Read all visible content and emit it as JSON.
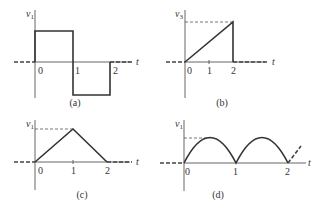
{
  "figure": {
    "panels": [
      {
        "id": "a",
        "caption": "(a)",
        "ylabel": "v",
        "ysub": "1",
        "xlabel": "t",
        "ticks": [
          "0",
          "1",
          "2"
        ],
        "shape": "square pulse: +1 on (0,1), -1 on (1,2), 0 elsewhere"
      },
      {
        "id": "b",
        "caption": "(b)",
        "ylabel": "v",
        "ysub": "3",
        "xlabel": "t",
        "ticks": [
          "0",
          "1",
          "2"
        ],
        "shape": "ramp from 0 at t=0 to peak at t=2, then drops to 0"
      },
      {
        "id": "c",
        "caption": "(c)",
        "ylabel": "v",
        "ysub": "1",
        "xlabel": "t",
        "ticks": [
          "0",
          "1",
          "2"
        ],
        "shape": "triangle: rises 0 to peak at t=1, falls to 0 at t=2"
      },
      {
        "id": "d",
        "caption": "(d)",
        "ylabel": "v",
        "ysub": "1",
        "xlabel": "t",
        "ticks": [
          "0",
          "1",
          "2"
        ],
        "shape": "rectified sine arches between 0,1,2 continuing"
      }
    ]
  }
}
